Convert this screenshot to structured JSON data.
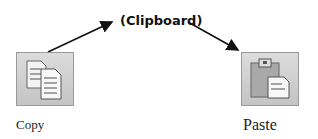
{
  "diagram": {
    "clipboard_label": "(Clipboard)",
    "copy": {
      "label": "Copy",
      "icon": "copy-icon"
    },
    "paste": {
      "label": "Paste",
      "icon": "paste-icon"
    }
  }
}
